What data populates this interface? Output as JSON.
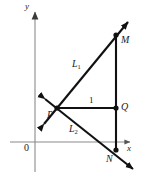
{
  "figure": {
    "type": "geometry-diagram",
    "axes": {
      "x_label": "x",
      "y_label": "y",
      "origin_label": "0",
      "x_axis_color": "#8a8a8a",
      "y_axis_color": "#8a8a8a"
    },
    "points": [
      {
        "id": "P",
        "label": "P",
        "x": 57,
        "y": 108
      },
      {
        "id": "Q",
        "label": "Q",
        "x": 116,
        "y": 108
      },
      {
        "id": "M",
        "label": "M",
        "x": 116,
        "y": 35
      },
      {
        "id": "N",
        "label": "N",
        "x": 116,
        "y": 150
      }
    ],
    "lines": [
      {
        "id": "L1",
        "label": "L",
        "subscript": "1",
        "from": "P",
        "through": "M",
        "arrows": "both"
      },
      {
        "id": "L2",
        "label": "L",
        "subscript": "2",
        "from": "P",
        "through": "N",
        "arrows": "both"
      }
    ],
    "segments": [
      {
        "id": "PQ",
        "from": "P",
        "to": "Q",
        "measure_label": "1"
      },
      {
        "id": "MN",
        "from": "M",
        "to": "N",
        "measure_label": ""
      }
    ],
    "stroke_color": "#111111"
  }
}
